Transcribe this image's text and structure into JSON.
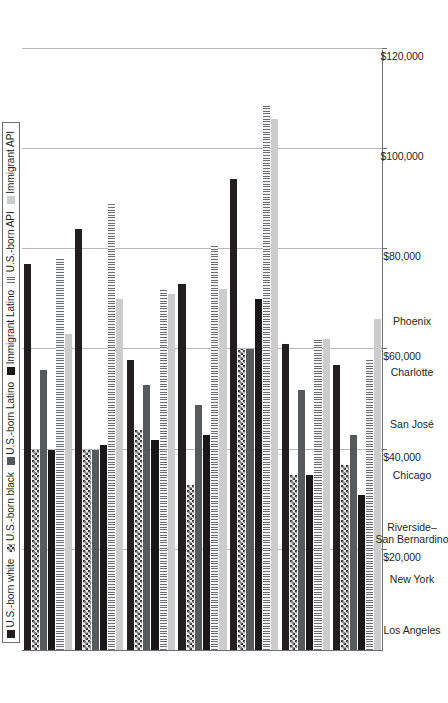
{
  "chart_data": {
    "type": "bar",
    "orientation": "horizontal-rotated",
    "title": "",
    "xlabel": "",
    "ylabel": "",
    "axis_tick_labels": [
      "$120,000",
      "$100,000",
      "$80,000",
      "$60,000",
      "$40,000",
      "$20,000"
    ],
    "axis_tick_values": [
      120000,
      100000,
      80000,
      60000,
      40000,
      20000
    ],
    "axis_range": [
      0,
      120000
    ],
    "grid": true,
    "legend_position": "top-left-inside",
    "categories": [
      "Los Angeles",
      "New York",
      "Riverside–\nSan Bernardino",
      "Chicago",
      "San José",
      "Charlotte",
      "Phoenix"
    ],
    "series": [
      {
        "name": "U.S.-born white",
        "key": "sw-white",
        "values": [
          77000,
          84000,
          58000,
          73000,
          94000,
          61000,
          57000
        ]
      },
      {
        "name": "U.S.-born black",
        "key": "sw-black",
        "values": [
          40000,
          40000,
          44000,
          33000,
          60000,
          35000,
          37000
        ]
      },
      {
        "name": "U.S.-born Latino",
        "key": "sw-latino",
        "values": [
          56000,
          40000,
          53000,
          49000,
          60000,
          52000,
          43000
        ]
      },
      {
        "name": "Immigrant Latino",
        "key": "sw-immlatino",
        "values": [
          40000,
          41000,
          42000,
          43000,
          70000,
          35000,
          31000
        ]
      },
      {
        "name": "U.S.-born API",
        "key": "sw-api",
        "values": [
          78000,
          89000,
          72000,
          81000,
          109000,
          62000,
          58000
        ]
      },
      {
        "name": "Immigrant API",
        "key": "sw-immapi",
        "values": [
          63000,
          70000,
          71000,
          72000,
          106000,
          62000,
          66000
        ]
      }
    ]
  },
  "legend": {
    "items": [
      {
        "label": "U.S.-born white",
        "swatch": "sw-white"
      },
      {
        "label": "U.S.-born black",
        "swatch": "sw-black"
      },
      {
        "label": "U.S.-born Latino",
        "swatch": "sw-latino"
      },
      {
        "label": "Immigrant Latino",
        "swatch": "sw-immlatino"
      },
      {
        "label": "U.S.-born API",
        "swatch": "sw-api"
      },
      {
        "label": "Immigrant API",
        "swatch": "sw-immapi"
      }
    ]
  },
  "colors": {
    "axis": "#6d6e71",
    "grid": "#b7b8ba",
    "text": "#231f20",
    "us_born_white": "#231f20",
    "us_born_latino": "#58595b",
    "immigrant_latino": "#1a1718",
    "immigrant_api": "#cccccc"
  }
}
